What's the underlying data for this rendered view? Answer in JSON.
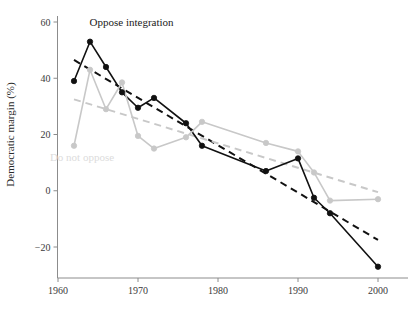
{
  "chart_data": {
    "type": "line",
    "title": "",
    "subtitle": "",
    "xlabel": "",
    "ylabel": "Democratic margin (%)",
    "xlim": [
      1960,
      2001
    ],
    "ylim": [
      -28,
      62
    ],
    "xticks": [
      1960,
      1970,
      1980,
      1990,
      2000
    ],
    "xticklabels": [
      "1960",
      "1970",
      "1980",
      "1990",
      "2000"
    ],
    "yticks": [
      60,
      40,
      20,
      0,
      -20
    ],
    "yticklabels": [
      "60",
      "40",
      "20",
      "0",
      "−20"
    ],
    "grid": false,
    "legend_position": "inline-annotations",
    "series": [
      {
        "name": "Oppose integration",
        "color": "#111111",
        "marker": "circle",
        "linestyle": "solid",
        "x": [
          1962,
          1964,
          1966,
          1968,
          1970,
          1972,
          1976,
          1978,
          1986,
          1990,
          1992,
          1994,
          2000
        ],
        "values": [
          39,
          53,
          44,
          35,
          29.5,
          33,
          24,
          16,
          7,
          11.5,
          -2.5,
          -8,
          -27
        ]
      },
      {
        "name": "Do not oppose",
        "color": "#c8c8c8",
        "marker": "circle",
        "linestyle": "solid",
        "x": [
          1962,
          1964,
          1966,
          1968,
          1970,
          1972,
          1976,
          1978,
          1986,
          1990,
          1992,
          1994,
          2000
        ],
        "values": [
          16,
          43,
          29,
          38.5,
          19.5,
          15,
          19,
          24.5,
          17,
          14,
          6.5,
          -3.5,
          -3
        ]
      }
    ],
    "trendlines": [
      {
        "name": "Oppose integration trend",
        "color": "#111111",
        "linestyle": "dashed",
        "x": [
          1962,
          2000
        ],
        "values": [
          46.5,
          -17.5
        ]
      },
      {
        "name": "Do not oppose trend",
        "color": "#c8c8c8",
        "linestyle": "dashed",
        "x": [
          1962,
          2000
        ],
        "values": [
          32.5,
          -0.5
        ]
      }
    ],
    "annotations": [
      {
        "text": "Oppose integration",
        "x": 1969.2,
        "y": 58.5,
        "color": "#1a1a1a"
      },
      {
        "text": "Do not oppose",
        "x": 1963.0,
        "y": 10.5,
        "color": "#dcdcdc"
      }
    ]
  },
  "axes": {
    "y_axis_title": "Democratic margin (%)",
    "x_axis_title": ""
  },
  "colors": {
    "dark_series": "#111111",
    "light_series": "#c8c8c8",
    "axis": "#8c8c8c",
    "text": "#2b2b2b",
    "background": "#ffffff"
  }
}
